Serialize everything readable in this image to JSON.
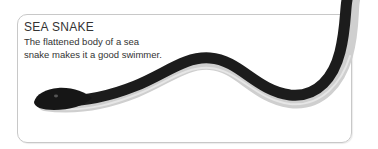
{
  "card": {
    "title": "SEA SNAKE",
    "caption": "The flattened body of a sea snake makes it a good swimmer."
  },
  "image": {
    "subject": "sea-snake-illustration",
    "colors": {
      "body_dark": "#1a1a1a",
      "belly_light": "#d8d8d8",
      "border": "#c8c8c8"
    }
  }
}
